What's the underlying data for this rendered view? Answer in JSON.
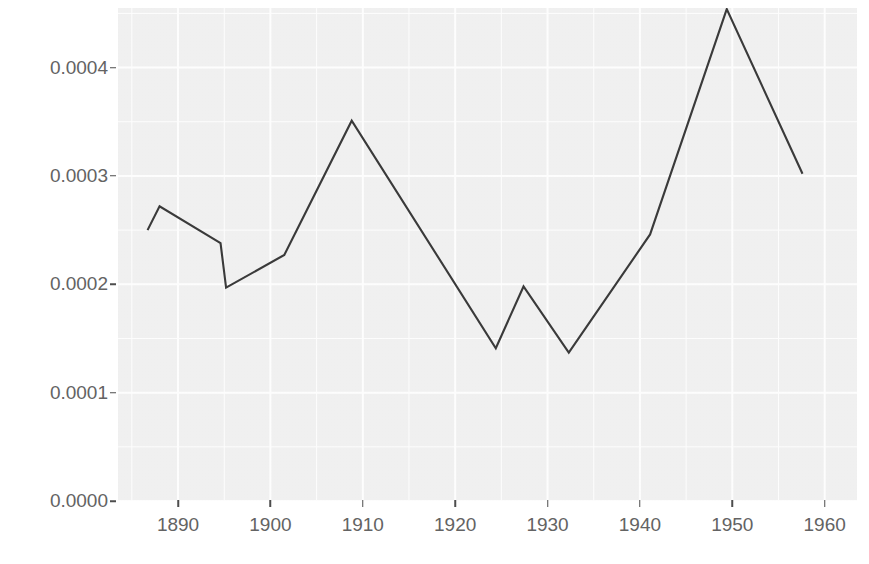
{
  "chart_data": {
    "type": "line",
    "title": "",
    "xlabel": "",
    "ylabel": "References to Japanese",
    "xlim": [
      1883.5,
      1963.5
    ],
    "ylim": [
      0.0,
      0.000455
    ],
    "grid": true,
    "legend": "none",
    "x_ticks": [
      1890,
      1900,
      1910,
      1920,
      1930,
      1940,
      1950,
      1960
    ],
    "x_tick_labels": [
      "1890",
      "1900",
      "1910",
      "1920",
      "1930",
      "1940",
      "1950",
      "1960"
    ],
    "y_ticks": [
      0.0,
      0.0001,
      0.0002,
      0.0003,
      0.0004
    ],
    "y_tick_labels": [
      "0.0000",
      "0.0001",
      "0.0002",
      "0.0003",
      "0.0004"
    ],
    "line_color": "#3a3a3a",
    "panel_color": "#f2f2f2",
    "gridline_color": "#ffffff",
    "series": [
      {
        "name": "References to Japanese",
        "x": [
          1886.7,
          1888.0,
          1894.6,
          1895.2,
          1901.5,
          1908.8,
          1924.4,
          1927.4,
          1932.3,
          1941.1,
          1949.4,
          1957.6
        ],
        "values": [
          0.00025,
          0.000272,
          0.000238,
          0.000197,
          0.000227,
          0.000351,
          0.000141,
          0.000198,
          0.000137,
          0.000246,
          0.000454,
          0.000302
        ]
      }
    ]
  },
  "axes": {
    "y_title": "References to Japanese"
  }
}
